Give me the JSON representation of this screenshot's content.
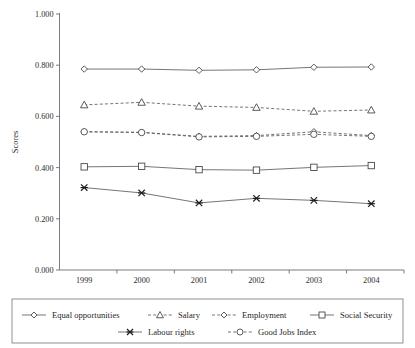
{
  "chart_data": {
    "type": "line",
    "title": "",
    "xlabel": "",
    "ylabel": "Scores",
    "categories": [
      "1999",
      "2000",
      "2001",
      "2002",
      "2003",
      "2004"
    ],
    "ylim": [
      0.0,
      1.0
    ],
    "ytick_labels": [
      "0.000",
      "0.200",
      "0.400",
      "0.600",
      "0.800",
      "1.000"
    ],
    "ytick_values": [
      0.0,
      0.2,
      0.4,
      0.6,
      0.8,
      1.0
    ],
    "grid": false,
    "legend_position": "bottom",
    "series": [
      {
        "name": "Equal opportunities",
        "marker": "diamond",
        "linestyle": "solid",
        "values": [
          0.785,
          0.785,
          0.78,
          0.782,
          0.792,
          0.793
        ]
      },
      {
        "name": "Salary",
        "marker": "triangle",
        "linestyle": "dashed",
        "values": [
          0.645,
          0.655,
          0.64,
          0.635,
          0.62,
          0.625
        ]
      },
      {
        "name": "Employment",
        "marker": "diamond",
        "linestyle": "dashed",
        "values": [
          0.54,
          0.538,
          0.522,
          0.525,
          0.54,
          0.525
        ]
      },
      {
        "name": "Social Security",
        "marker": "square",
        "linestyle": "solid",
        "values": [
          0.403,
          0.405,
          0.392,
          0.39,
          0.401,
          0.408
        ]
      },
      {
        "name": "Labour rights",
        "marker": "x",
        "linestyle": "solid",
        "values": [
          0.322,
          0.301,
          0.262,
          0.28,
          0.272,
          0.259
        ]
      },
      {
        "name": "Good Jobs Index",
        "marker": "circle",
        "linestyle": "dashed",
        "values": [
          0.54,
          0.537,
          0.52,
          0.522,
          0.53,
          0.522
        ]
      }
    ]
  },
  "legend": {
    "row1": [
      "Equal opportunities",
      "Salary",
      "Employment",
      "Social Security"
    ],
    "row2": [
      "Labour rights",
      "Good Jobs Index"
    ]
  },
  "colors": {
    "line": "#5c5c5c",
    "marker_stroke": "#3f3f3f",
    "marker_fill": "#ffffff",
    "axis": "#6e6e6e",
    "text": "#1f1f1f",
    "background": "#ffffff"
  }
}
